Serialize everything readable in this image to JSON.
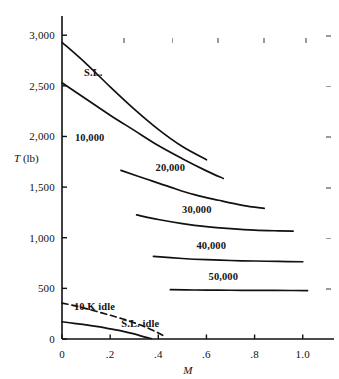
{
  "figure": {
    "background_color": "#ffffff",
    "ink_color": "#111111",
    "faint_tick_color": "#9a9a9a"
  },
  "axes": {
    "x_title": "M",
    "y_title_symbol": "T",
    "y_title_unit": "(lb)"
  },
  "chart_data": {
    "type": "line",
    "title": "",
    "subtitle": "",
    "xlabel": "M",
    "ylabel": "T (lb)",
    "xlim": [
      0,
      1.08
    ],
    "ylim": [
      0,
      3150
    ],
    "xticks": [
      0,
      0.2,
      0.4,
      0.6,
      0.8,
      1.0
    ],
    "xticklabels": [
      "0",
      ".2",
      ".4",
      ".6",
      ".8",
      "1.0"
    ],
    "yticks": [
      0,
      500,
      1000,
      1500,
      2000,
      2500,
      3000
    ],
    "yticklabels": [
      "0",
      "500",
      "1,000",
      "1,500",
      "2,000",
      "2,500",
      "3,000"
    ],
    "grid": false,
    "legend": "inline-curve-labels",
    "series": [
      {
        "name": "S.L.",
        "label": "S.L.",
        "style": "solid",
        "label_x": 0.13,
        "label_y": 2640,
        "x": [
          0.0,
          0.1,
          0.2,
          0.3,
          0.4,
          0.5,
          0.6
        ],
        "y": [
          2930,
          2720,
          2490,
          2270,
          2070,
          1900,
          1770
        ]
      },
      {
        "name": "10,000",
        "label": "10,000",
        "style": "solid",
        "label_x": 0.115,
        "label_y": 1990,
        "x": [
          0.0,
          0.1,
          0.2,
          0.3,
          0.4,
          0.5,
          0.6,
          0.67
        ],
        "y": [
          2530,
          2370,
          2210,
          2060,
          1910,
          1780,
          1660,
          1585
        ]
      },
      {
        "name": "20,000",
        "label": "20,000",
        "style": "solid",
        "label_x": 0.45,
        "label_y": 1700,
        "x": [
          0.245,
          0.35,
          0.45,
          0.55,
          0.65,
          0.75,
          0.84
        ],
        "y": [
          1665,
          1580,
          1500,
          1425,
          1370,
          1320,
          1290
        ]
      },
      {
        "name": "30,000",
        "label": "30,000",
        "style": "solid",
        "label_x": 0.56,
        "label_y": 1285,
        "x": [
          0.31,
          0.4,
          0.5,
          0.6,
          0.7,
          0.8,
          0.9,
          0.96
        ],
        "y": [
          1225,
          1180,
          1140,
          1110,
          1090,
          1075,
          1068,
          1065
        ]
      },
      {
        "name": "40,000",
        "label": "40,000",
        "style": "solid",
        "label_x": 0.62,
        "label_y": 925,
        "x": [
          0.38,
          0.5,
          0.6,
          0.7,
          0.8,
          0.9,
          1.0
        ],
        "y": [
          815,
          795,
          783,
          775,
          770,
          766,
          763
        ]
      },
      {
        "name": "50,000",
        "label": "50,000",
        "style": "solid",
        "label_x": 0.67,
        "label_y": 625,
        "x": [
          0.45,
          0.55,
          0.65,
          0.75,
          0.85,
          0.95,
          1.02
        ],
        "y": [
          487,
          484,
          482,
          481,
          480,
          479,
          478
        ]
      },
      {
        "name": "10 K idle",
        "label": "10 K idle",
        "style": "dashed",
        "label_x": 0.135,
        "label_y": 330,
        "x": [
          0.0,
          0.05,
          0.1,
          0.15,
          0.2,
          0.25,
          0.3,
          0.35,
          0.4,
          0.43
        ],
        "y": [
          355,
          330,
          300,
          268,
          235,
          200,
          160,
          115,
          60,
          20
        ]
      },
      {
        "name": "S.L. idle",
        "label": "S.L. idle",
        "style": "solid",
        "label_x": 0.325,
        "label_y": 160,
        "x": [
          0.0,
          0.05,
          0.1,
          0.15,
          0.2,
          0.25,
          0.3,
          0.345,
          0.37
        ],
        "y": [
          170,
          155,
          140,
          122,
          100,
          78,
          50,
          18,
          5
        ]
      }
    ]
  },
  "faint_edge_ticks": {
    "top": [
      {
        "x": 0.255
      },
      {
        "x": 0.455
      },
      {
        "x": 0.645
      },
      {
        "x": 0.835
      },
      {
        "x": 1.01
      }
    ],
    "right": [
      {
        "y": 3000
      },
      {
        "y": 2500
      },
      {
        "y": 2000
      },
      {
        "y": 1500
      },
      {
        "y": 1000
      },
      {
        "y": 500
      }
    ]
  }
}
